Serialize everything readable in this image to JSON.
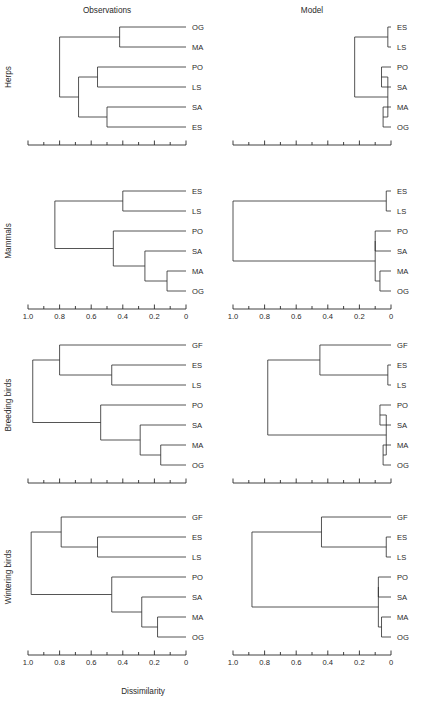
{
  "figure": {
    "column_headers": [
      "Observations",
      "Model"
    ],
    "row_labels": [
      "Herps",
      "Mammals",
      "Breeding birds",
      "Wintering birds"
    ],
    "axis_title": "Dissimilarity",
    "tick_labels": [
      "1.0",
      "0.8",
      "0.6",
      "0.4",
      "0.2",
      "0"
    ],
    "line_color": "#2a2a2a",
    "background": "#ffffff"
  },
  "chart_data": {
    "type": "dendrogram",
    "title": "",
    "xlabel": "Dissimilarity",
    "ylabel": "",
    "xlim": [
      1.0,
      0.0
    ],
    "x_ticks": [
      1.0,
      0.9,
      0.8,
      0.7,
      0.6,
      0.5,
      0.4,
      0.3,
      0.2,
      0.1,
      0.0
    ],
    "x_tick_labels": [
      "1.0",
      "",
      "0.8",
      "",
      "0.6",
      "",
      "0.4",
      "",
      "0.2",
      "",
      "0"
    ],
    "axis_direction": "reversed",
    "grid": false,
    "legend": "none",
    "columns": [
      "Observations",
      "Model"
    ],
    "rows": [
      "Herps",
      "Mammals",
      "Breeding birds",
      "Wintering birds"
    ],
    "panels": [
      {
        "row": "Herps",
        "column": "Observations",
        "leaves": [
          "OG",
          "MA",
          "PO",
          "LS",
          "SA",
          "ES"
        ],
        "merges": [
          {
            "left": "OG",
            "right": "MA",
            "height": 0.42
          },
          {
            "left": "PO",
            "right": "LS",
            "height": 0.56
          },
          {
            "left": "SA",
            "right": "ES",
            "height": 0.5
          },
          {
            "left": "node_PO_LS",
            "right": "node_SA_ES",
            "height": 0.68
          },
          {
            "left": "node_OG_MA",
            "right": "node_PO_LS_SA_ES",
            "height": 0.8
          }
        ]
      },
      {
        "row": "Herps",
        "column": "Model",
        "leaves": [
          "ES",
          "LS",
          "PO",
          "SA",
          "MA",
          "OG"
        ],
        "merges": [
          {
            "left": "ES",
            "right": "LS",
            "height": 0.02
          },
          {
            "left": "PO",
            "right": "SA",
            "height": 0.06
          },
          {
            "left": "MA",
            "right": "OG",
            "height": 0.05
          },
          {
            "left": "node_PO_SA",
            "right": "node_MA_OG",
            "height": 0.02
          },
          {
            "left": "node_ES_LS",
            "right": "node_PO_SA_MA_OG",
            "height": 0.23
          }
        ]
      },
      {
        "row": "Mammals",
        "column": "Observations",
        "leaves": [
          "ES",
          "LS",
          "PO",
          "SA",
          "MA",
          "OG"
        ],
        "merges": [
          {
            "left": "ES",
            "right": "LS",
            "height": 0.4
          },
          {
            "left": "MA",
            "right": "OG",
            "height": 0.12
          },
          {
            "left": "SA",
            "right": "node_MA_OG",
            "height": 0.26
          },
          {
            "left": "PO",
            "right": "node_SA_MA_OG",
            "height": 0.46
          },
          {
            "left": "node_ES_LS",
            "right": "node_PO_SA_MA_OG",
            "height": 0.83
          }
        ]
      },
      {
        "row": "Mammals",
        "column": "Model",
        "leaves": [
          "ES",
          "LS",
          "PO",
          "SA",
          "MA",
          "OG"
        ],
        "merges": [
          {
            "left": "ES",
            "right": "LS",
            "height": 0.03
          },
          {
            "left": "PO",
            "right": "SA",
            "height": 0.1
          },
          {
            "left": "MA",
            "right": "OG",
            "height": 0.07
          },
          {
            "left": "node_PO_SA",
            "right": "node_MA_OG",
            "height": 0.1
          },
          {
            "left": "node_ES_LS",
            "right": "node_PO_SA_MA_OG",
            "height": 1.0
          }
        ]
      },
      {
        "row": "Breeding birds",
        "column": "Observations",
        "leaves": [
          "GF",
          "ES",
          "LS",
          "PO",
          "SA",
          "MA",
          "OG"
        ],
        "merges": [
          {
            "left": "ES",
            "right": "LS",
            "height": 0.47
          },
          {
            "left": "MA",
            "right": "OG",
            "height": 0.16
          },
          {
            "left": "SA",
            "right": "node_MA_OG",
            "height": 0.29
          },
          {
            "left": "PO",
            "right": "node_SA_MA_OG",
            "height": 0.54
          },
          {
            "left": "GF",
            "right": "node_ES_LS",
            "height": 0.8
          },
          {
            "left": "node_GF_ES_LS",
            "right": "node_PO_SA_MA_OG",
            "height": 0.97
          }
        ]
      },
      {
        "row": "Breeding birds",
        "column": "Model",
        "leaves": [
          "GF",
          "ES",
          "LS",
          "PO",
          "SA",
          "MA",
          "OG"
        ],
        "merges": [
          {
            "left": "ES",
            "right": "LS",
            "height": 0.02
          },
          {
            "left": "GF",
            "right": "node_ES_LS",
            "height": 0.45
          },
          {
            "left": "PO",
            "right": "SA",
            "height": 0.07
          },
          {
            "left": "MA",
            "right": "OG",
            "height": 0.05
          },
          {
            "left": "node_PO_SA",
            "right": "node_MA_OG",
            "height": 0.03
          },
          {
            "left": "node_GF_ES_LS",
            "right": "node_PO_SA_MA_OG",
            "height": 0.78
          }
        ]
      },
      {
        "row": "Wintering birds",
        "column": "Observations",
        "leaves": [
          "GF",
          "ES",
          "LS",
          "PO",
          "SA",
          "MA",
          "OG"
        ],
        "merges": [
          {
            "left": "ES",
            "right": "LS",
            "height": 0.56
          },
          {
            "left": "GF",
            "right": "node_ES_LS",
            "height": 0.79
          },
          {
            "left": "MA",
            "right": "OG",
            "height": 0.18
          },
          {
            "left": "SA",
            "right": "node_MA_OG",
            "height": 0.28
          },
          {
            "left": "PO",
            "right": "node_SA_MA_OG",
            "height": 0.47
          },
          {
            "left": "node_GF_ES_LS",
            "right": "node_PO_SA_MA_OG",
            "height": 0.98
          }
        ]
      },
      {
        "row": "Wintering birds",
        "column": "Model",
        "leaves": [
          "GF",
          "ES",
          "LS",
          "PO",
          "SA",
          "MA",
          "OG"
        ],
        "merges": [
          {
            "left": "ES",
            "right": "LS",
            "height": 0.03
          },
          {
            "left": "GF",
            "right": "node_ES_LS",
            "height": 0.44
          },
          {
            "left": "PO",
            "right": "SA",
            "height": 0.08
          },
          {
            "left": "MA",
            "right": "OG",
            "height": 0.06
          },
          {
            "left": "node_PO_SA",
            "right": "node_MA_OG",
            "height": 0.08
          },
          {
            "left": "node_GF_ES_LS",
            "right": "node_PO_SA_MA_OG",
            "height": 0.88
          }
        ]
      }
    ]
  }
}
